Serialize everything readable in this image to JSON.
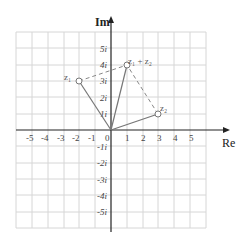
{
  "diagram": {
    "axes": {
      "x_label": "Re",
      "y_label": "Im",
      "x_ticks": [
        "-5",
        "-4",
        "-3",
        "-2",
        "-1",
        "0",
        "1",
        "2",
        "3",
        "4",
        "5"
      ],
      "y_ticks_pos": [
        "1i",
        "2i",
        "3i",
        "4i",
        "5i"
      ],
      "y_ticks_neg": [
        "-1i",
        "-2i",
        "-3i",
        "-4i",
        "-5i"
      ]
    },
    "points": {
      "z1": {
        "label": "z₁",
        "re": -2,
        "im": 3
      },
      "z2": {
        "label": "z₂",
        "re": 3,
        "im": 1
      },
      "sum": {
        "label": "z₁ + z₂",
        "re": 1,
        "im": 4
      }
    },
    "colors": {
      "grid": "#d6d6d6",
      "axis": "#222222",
      "vector": "#777777",
      "dashed": "#888888",
      "point": "#777777"
    }
  }
}
